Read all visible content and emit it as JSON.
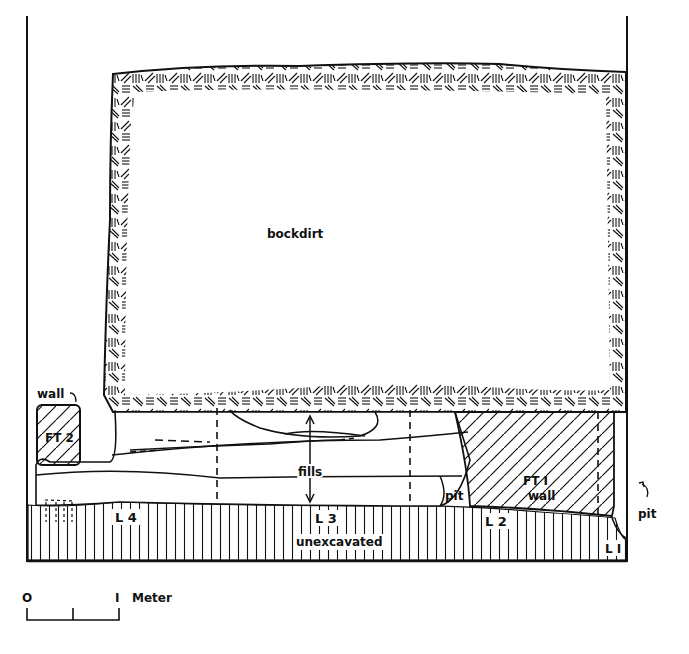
{
  "diagram": {
    "type": "archaeological excavation profile / section",
    "colors": {
      "ink": "#111111",
      "background": "#ffffff"
    },
    "labels": {
      "backdirt": "bockdirt",
      "wall_top": "wall",
      "ft2": "FT 2",
      "fills": "fills",
      "ft1_line1": "FT I",
      "ft1_line2": "wall",
      "pit_center": "pit",
      "pit_right": "pit",
      "l1": "L I",
      "l2": "L 2",
      "l3": "L 3",
      "l4": "L 4",
      "unexcavated": "unexcavated"
    },
    "layers": [
      {
        "id": "L1",
        "label": "L I"
      },
      {
        "id": "L2",
        "label": "L 2"
      },
      {
        "id": "L3",
        "label": "L 3"
      },
      {
        "id": "L4",
        "label": "L 4"
      }
    ],
    "features": [
      {
        "id": "FT1",
        "label": "FT I wall"
      },
      {
        "id": "FT2",
        "label": "FT 2"
      }
    ]
  },
  "scale_bar": {
    "start": "O",
    "end": "I",
    "unit": "Meter"
  }
}
